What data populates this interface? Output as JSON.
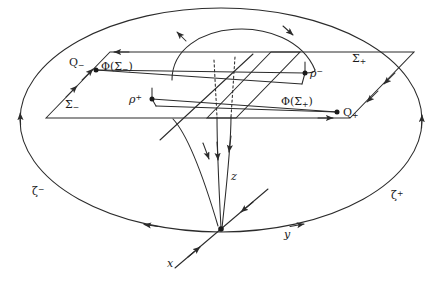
{
  "figure": {
    "kind": "mathematical-phase-portrait-diagram",
    "background_color": "#ffffff",
    "stroke_color": "#2b2b2b",
    "width": 443,
    "height": 284
  },
  "labels": {
    "sigma_minus": "Σ",
    "sigma_minus_sub": "−",
    "sigma_plus": "Σ",
    "sigma_plus_sub": "+",
    "phi_sigma_minus": "Φ(Σ",
    "phi_sigma_minus_tail": ")",
    "phi_sigma_minus_sub": "−",
    "phi_sigma_plus": "Φ(Σ",
    "phi_sigma_plus_tail": ")",
    "phi_sigma_plus_sub": "+",
    "q_minus": "Q",
    "q_minus_sub": "−",
    "q_plus": "Q",
    "q_plus_sub": "+",
    "rho_plus": "ρ",
    "rho_plus_sup": "+",
    "rho_minus": "ρ",
    "rho_minus_sup": "−",
    "zeta_minus": "ζ",
    "zeta_minus_sup": "−",
    "zeta_plus": "ζ",
    "zeta_plus_sup": "+",
    "axis_x": "x",
    "axis_y": "y",
    "axis_z": "z"
  },
  "points": {
    "origin": {
      "x": 221,
      "y": 230
    },
    "q_minus": {
      "x": 96,
      "y": 70
    },
    "q_plus": {
      "x": 337,
      "y": 112
    },
    "rho_plus": {
      "x": 152,
      "y": 99
    },
    "rho_minus": {
      "x": 305,
      "y": 73
    }
  },
  "ellipse": {
    "cx": 221,
    "cy": 120,
    "rx": 201,
    "ry": 112,
    "name": "invariant-manifold-boundary"
  },
  "planes": [
    {
      "name": "sigma-minus-plane",
      "corners": "46,118 110,52 300,52 236,118"
    },
    {
      "name": "sigma-plus-plane",
      "corners": "207,118 271,52 414,52 350,118"
    }
  ],
  "wedges": [
    {
      "name": "phi-sigma-minus-wedge",
      "path": "96,70 126,66 305,73 302,83"
    },
    {
      "name": "phi-sigma-plus-wedge",
      "path": "152,99 337,112 335,122 158,104"
    }
  ],
  "arrow_marks": [
    {
      "name": "ellipse-left-arrow",
      "direction": "up"
    },
    {
      "name": "ellipse-right-arrow",
      "direction": "up"
    },
    {
      "name": "ellipse-bottom-left-arrow",
      "direction": "left"
    },
    {
      "name": "ellipse-bottom-right-arrow",
      "direction": "right"
    },
    {
      "name": "top-arc-left-arrow",
      "direction": "down-left"
    },
    {
      "name": "top-arc-right-arrow",
      "direction": "down-right"
    },
    {
      "name": "z-funnel-arrows",
      "count": 3,
      "direction": "down"
    },
    {
      "name": "x-axis-arrow",
      "direction": "up-right"
    },
    {
      "name": "x-axis-far-arrow",
      "direction": "down-left"
    }
  ]
}
